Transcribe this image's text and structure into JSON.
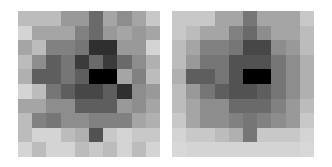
{
  "chart_data": [
    {
      "type": "heatmap",
      "title": "",
      "colormap": "gray_r",
      "rows": 10,
      "cols": 10,
      "grid": false,
      "values": [
        [
          0.2,
          0.2,
          0.2,
          0.35,
          0.35,
          0.55,
          0.3,
          0.4,
          0.3,
          0.15
        ],
        [
          0.1,
          0.3,
          0.3,
          0.3,
          0.45,
          0.55,
          0.35,
          0.3,
          0.35,
          0.3
        ],
        [
          0.3,
          0.2,
          0.45,
          0.45,
          0.5,
          0.8,
          0.8,
          0.35,
          0.35,
          0.1
        ],
        [
          0.2,
          0.4,
          0.6,
          0.5,
          0.75,
          0.55,
          0.75,
          0.55,
          0.4,
          0.25
        ],
        [
          0.25,
          0.6,
          0.6,
          0.5,
          0.6,
          1.0,
          1.0,
          0.3,
          0.45,
          0.2
        ],
        [
          0.1,
          0.2,
          0.5,
          0.6,
          0.7,
          0.7,
          0.6,
          0.8,
          0.4,
          0.35
        ],
        [
          0.3,
          0.3,
          0.4,
          0.4,
          0.6,
          0.6,
          0.6,
          0.35,
          0.4,
          0.3
        ],
        [
          0.2,
          0.45,
          0.5,
          0.4,
          0.4,
          0.45,
          0.45,
          0.45,
          0.3,
          0.25
        ],
        [
          0.2,
          0.1,
          0.1,
          0.2,
          0.25,
          0.65,
          0.15,
          0.1,
          0.15,
          0.15
        ],
        [
          0.1,
          0.2,
          0.1,
          0.1,
          0.2,
          0.15,
          0.2,
          0.1,
          0.2,
          0.1
        ]
      ]
    },
    {
      "type": "heatmap",
      "title": "",
      "colormap": "gray_r",
      "rows": 10,
      "cols": 10,
      "grid": false,
      "values": [
        [
          0.15,
          0.15,
          0.15,
          0.3,
          0.3,
          0.5,
          0.3,
          0.3,
          0.3,
          0.15
        ],
        [
          0.15,
          0.2,
          0.3,
          0.3,
          0.45,
          0.55,
          0.4,
          0.3,
          0.3,
          0.2
        ],
        [
          0.2,
          0.3,
          0.45,
          0.45,
          0.5,
          0.7,
          0.7,
          0.4,
          0.35,
          0.2
        ],
        [
          0.2,
          0.35,
          0.5,
          0.5,
          0.65,
          0.65,
          0.65,
          0.5,
          0.4,
          0.25
        ],
        [
          0.25,
          0.6,
          0.6,
          0.5,
          0.65,
          1.0,
          1.0,
          0.5,
          0.4,
          0.25
        ],
        [
          0.2,
          0.35,
          0.5,
          0.6,
          0.65,
          0.65,
          0.6,
          0.5,
          0.4,
          0.25
        ],
        [
          0.2,
          0.3,
          0.4,
          0.4,
          0.55,
          0.55,
          0.55,
          0.45,
          0.35,
          0.2
        ],
        [
          0.15,
          0.3,
          0.4,
          0.4,
          0.45,
          0.5,
          0.45,
          0.4,
          0.35,
          0.15
        ],
        [
          0.1,
          0.15,
          0.15,
          0.2,
          0.25,
          0.5,
          0.15,
          0.15,
          0.15,
          0.1
        ],
        [
          0.08,
          0.1,
          0.1,
          0.1,
          0.1,
          0.1,
          0.1,
          0.1,
          0.1,
          0.08
        ]
      ]
    }
  ]
}
